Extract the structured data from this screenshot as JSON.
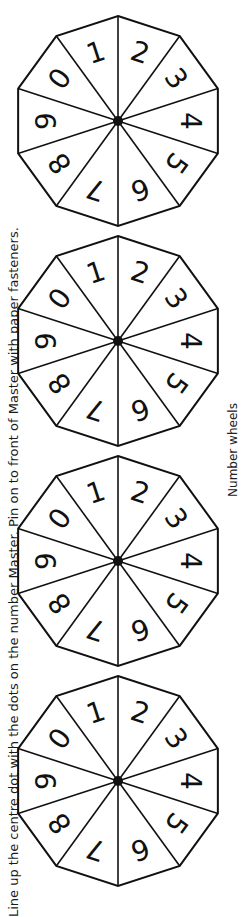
{
  "instructions": "Line up the centre dot with the dots on the number Master. Pin on to front of Master with paper fasteners.",
  "caption": "Number wheels",
  "wheel_digits": [
    "2",
    "3",
    "4",
    "5",
    "6",
    "7",
    "8",
    "9",
    "0",
    "1"
  ],
  "wheels": [
    {
      "id": 1,
      "cx": 118,
      "cy": 121
    },
    {
      "id": 2,
      "cx": 118,
      "cy": 341
    },
    {
      "id": 3,
      "cx": 118,
      "cy": 561
    },
    {
      "id": 4,
      "cx": 118,
      "cy": 781
    }
  ],
  "colors": {
    "line": "#111111",
    "background": "#ffffff"
  }
}
